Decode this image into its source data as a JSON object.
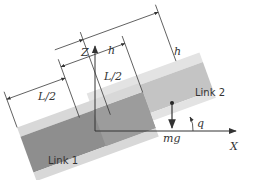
{
  "diagram": {
    "axes": {
      "vertical_label": "Z",
      "horizontal_label": "X"
    },
    "links": [
      {
        "name": "Link 1"
      },
      {
        "name": "Link 2"
      }
    ],
    "dimensions": {
      "h_upper_left": "h",
      "h_upper_right": "h",
      "half_length_middle": "L/2",
      "half_length_left": "L/2"
    },
    "force_label": "mg",
    "angle_label": "q",
    "colors": {
      "link1_dark": "#8c8c8c",
      "link1_light": "#d4d4d4",
      "link2_dark": "#bdbdbd",
      "link2_light": "#dedede",
      "overlap": "#9a9a9a",
      "line": "#333333"
    }
  }
}
